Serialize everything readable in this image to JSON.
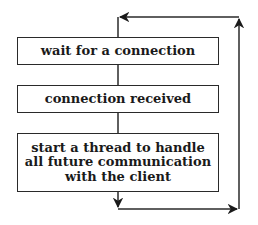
{
  "diagram": {
    "type": "flowchart",
    "colors": {
      "line": "#2a2a2a",
      "text": "#1a1a1a",
      "background": "#ffffff"
    },
    "steps": [
      {
        "id": "wait",
        "label": "wait for a connection"
      },
      {
        "id": "received",
        "label": "connection received"
      },
      {
        "id": "thread",
        "label_lines": [
          "start a thread to handle",
          "all future communication",
          "with the client"
        ]
      }
    ],
    "edges": [
      {
        "from": "wait",
        "to": "received",
        "style": "line"
      },
      {
        "from": "received",
        "to": "thread",
        "style": "line"
      },
      {
        "from": "thread",
        "to": "wait",
        "style": "loop-back-arrow",
        "route": "down, right, up, left"
      }
    ]
  }
}
